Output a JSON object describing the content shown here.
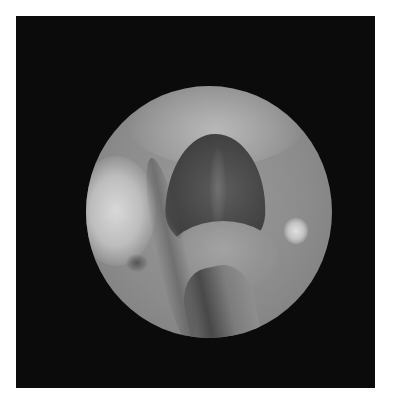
{
  "image": {
    "subject": "endoscopic view",
    "colors": {
      "page_background": "#ffffff",
      "frame_background": "#0b0b0b",
      "tissue_mid": "#8c8c8c",
      "cavity_dark": "#444444",
      "highlight": "#d8d8d8"
    }
  }
}
